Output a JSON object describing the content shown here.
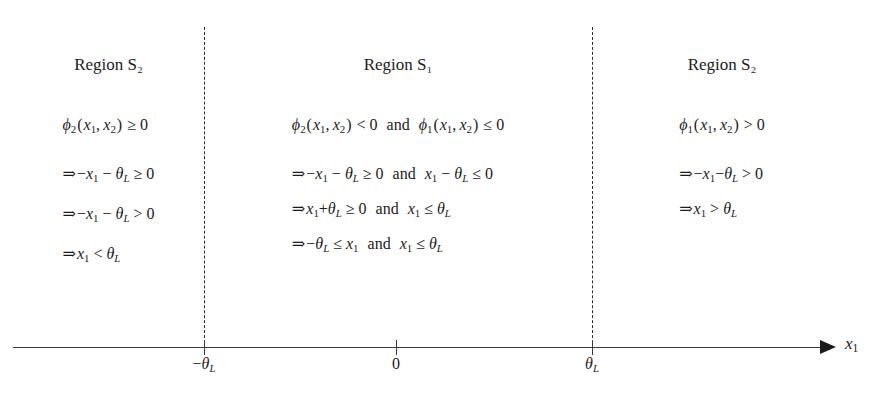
{
  "figure": {
    "kind": "number-line-region-diagram",
    "background_color": "#ffffff",
    "ink_color": "#1b1b1b"
  },
  "axis": {
    "label": "x₁",
    "arrow_direction": "right",
    "ticks": [
      {
        "id": "neg-theta",
        "label": "−θL",
        "x": 204
      },
      {
        "id": "zero",
        "label": "0",
        "x": 396
      },
      {
        "id": "pos-theta",
        "label": "θL",
        "x": 592
      }
    ]
  },
  "dividers": [
    {
      "id": "divider-left",
      "x": 204
    },
    {
      "id": "divider-right",
      "x": 592
    }
  ],
  "regions": [
    {
      "id": "region-left",
      "title": "Region S₂",
      "rows": [
        "ϕ₂(x₁, x₂) ≥ 0",
        "⇒ −x₁ − θL ≥ 0",
        "⇒ −x₁ − θL > 0",
        "⇒ x₁ < θL"
      ]
    },
    {
      "id": "region-middle",
      "title": "Region S₁",
      "rows": [
        "ϕ₂(x₁, x₂) < 0   and   ϕ₁(x₁, x₂) ≤ 0",
        "⇒ −x₁ − θL ≥ 0   and   x₁ − θL ≤ 0",
        "⇒ x₁ + θL ≥ 0   and   x₁ ≤ θL",
        "⇒ −θL ≤ x₁   and   x₁ ≤ θL"
      ]
    },
    {
      "id": "region-right",
      "title": "Region S₂",
      "rows": [
        "ϕ₁(x₁, x₂) > 0",
        "⇒ −x₁ − θL > 0",
        "⇒ x₁ > θL"
      ]
    }
  ],
  "glyphs": {
    "implies": "⇒",
    "phi": "ϕ",
    "theta": "θ",
    "and": "and",
    "ge": "≥",
    "le": "≤",
    "lt": "<",
    "gt": ">",
    "minus": "−",
    "plus": "+",
    "zero": "0"
  }
}
